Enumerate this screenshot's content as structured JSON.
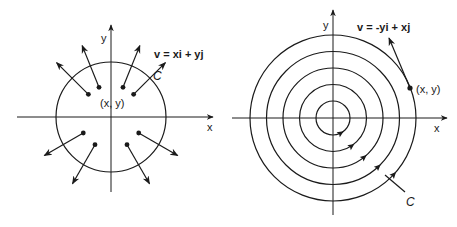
{
  "figures": {
    "radial": {
      "axis_x_label": "x",
      "axis_y_label": "y",
      "vector_label": "v = xi + yj",
      "curve_label": "C",
      "point_label": "(x, y)",
      "vector_directions_deg": [
        135,
        112,
        68,
        45,
        210,
        240,
        300,
        330
      ]
    },
    "rotational": {
      "axis_x_label": "x",
      "axis_y_label": "y",
      "vector_label": "v = -yi + xj",
      "curve_label": "C",
      "point_label": "(x, y)",
      "circle_count": 5
    }
  },
  "colors": {
    "ink": "#1a1a1a",
    "background": "#ffffff"
  }
}
